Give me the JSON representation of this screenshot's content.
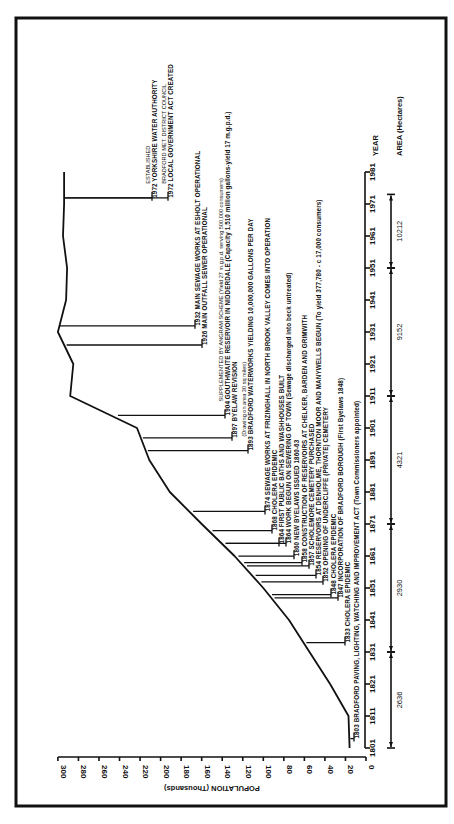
{
  "chart_data": {
    "type": "line",
    "orientation": "rotated-90 (years run bottom-to-top, population increases right-to-left)",
    "title": "",
    "xlabel": "YEAR",
    "ylabel": "POPULATION (Thousands)",
    "ylim": [
      0,
      300
    ],
    "y_ticks": [
      0,
      20,
      40,
      60,
      80,
      100,
      120,
      140,
      160,
      180,
      200,
      220,
      240,
      260,
      280,
      300
    ],
    "x_ticks": [
      1801,
      1811,
      1821,
      1831,
      1841,
      1851,
      1861,
      1871,
      1881,
      1891,
      1901,
      1911,
      1921,
      1931,
      1941,
      1951,
      1961,
      1971,
      1981
    ],
    "series": [
      {
        "name": "Population (Thousands)",
        "x": [
          1801,
          1811,
          1821,
          1831,
          1841,
          1851,
          1861,
          1871,
          1881,
          1891,
          1901,
          1911,
          1921,
          1931,
          1941,
          1951,
          1961,
          1971,
          1981
        ],
        "values": [
          16,
          17,
          35,
          55,
          75,
          100,
          128,
          160,
          191,
          211,
          223,
          288,
          285,
          300,
          292,
          291,
          295,
          294,
          294
        ]
      }
    ],
    "area_hectares": [
      {
        "from": 1801,
        "to": 1831,
        "value": "2636"
      },
      {
        "from": 1831,
        "to": 1871,
        "value": "2930"
      },
      {
        "from": 1871,
        "to": 1911,
        "value": "4321"
      },
      {
        "from": 1911,
        "to": 1951,
        "value": "9152"
      },
      {
        "from": 1951,
        "to": 1974,
        "value": "10212"
      }
    ],
    "area_label": "AREA (Hectares)",
    "annotations": [
      {
        "year": 1803,
        "lines": [
          "1803 BRADFORD PAVING, LIGHTING, WATCHING AND IMPROVEMENT ACT (Town Commissioners appointed)"
        ]
      },
      {
        "year": 1833,
        "lines": [
          "1833 CHOLERA EPIDEMIC"
        ]
      },
      {
        "year": 1847,
        "lines": [
          "1847 INCORPORATION OF BRADFORD BOROUGH (First Byelaws 1848)"
        ]
      },
      {
        "year": 1848,
        "lines": [
          "1848 CHOLERA EPIDEMIC"
        ]
      },
      {
        "year": 1852,
        "lines": [
          "1852 OPENING OF UNDERCLIFFE (PRIVATE) CEMETERY"
        ]
      },
      {
        "year": 1854,
        "lines": [
          "1854 RESERVOIRS AT DENHOLME, THORNTON MOOR AND MANYWELLS BEGUN (To yield 377,780 - c 17,000 consumers)"
        ]
      },
      {
        "year": 1857,
        "lines": [
          "1857 SCHOLEMORE CEMETERY PURCHASED"
        ]
      },
      {
        "year": 1858,
        "lines": [
          "1858 CONSTRUCTION OF RESERVOIRS AT CHELKER, BARDEN AND GRIMWITH"
        ]
      },
      {
        "year": 1860,
        "lines": [
          "1860 NEW BYELAWS ISSUED 1860-63"
        ]
      },
      {
        "year": 1864,
        "lines": [
          "1864 WORK BEGUN ON SEWERING OF TOWN (Sewage discharged into beck untreated)"
        ]
      },
      {
        "year": 1864,
        "lines": [
          "1864 FIRST PUBLIC BATHS AND WASHHOUSES BUILT"
        ]
      },
      {
        "year": 1868,
        "lines": [
          "1868 CHOLERA EPIDEMIC"
        ]
      },
      {
        "year": 1874,
        "lines": [
          "1874 SEWAGE WORKS AT FRIZINGHALL IN NORTH BROOK VALLEY COMES INTO OPERATION"
        ]
      },
      {
        "year": 1893,
        "lines": [
          "1893 BRADFORD WATERWORKS YIELDING 10,000,000 GALLONS PER DAY",
          "(Drawing on area 30 sq miles)"
        ]
      },
      {
        "year": 1897,
        "lines": [
          "1897 BYELAW REVISION"
        ]
      },
      {
        "year": 1904,
        "lines": [
          "1904 GOUTHWAITE RESERVOIR IN NIDDERDALE (Capacity 1,510 million gallons-yield 17 m.g.p.d.)",
          "SUPPLEMENTED BY ANGRAM SCHEME (Yield 27 m.g.p.d. serving 500,000 consumers)"
        ]
      },
      {
        "year": 1926,
        "lines": [
          "1926 MAIN OUTFALL SEWER OPERATIONAL"
        ]
      },
      {
        "year": 1932,
        "lines": [
          "1932 MAIN SEWAGE WORKS AT ESHOLT OPERATIONAL"
        ]
      },
      {
        "year": 1972,
        "lines": [
          "1972 LOCAL GOVERNMENT ACT CREATED",
          "BRADFORD MET. DISTRICT COUNCIL"
        ]
      },
      {
        "year": 1972,
        "lines": [
          "1972 YORKSHIRE WATER AUTHORITY",
          "ESTABLISHED"
        ]
      }
    ],
    "grid": false,
    "legend": null
  }
}
